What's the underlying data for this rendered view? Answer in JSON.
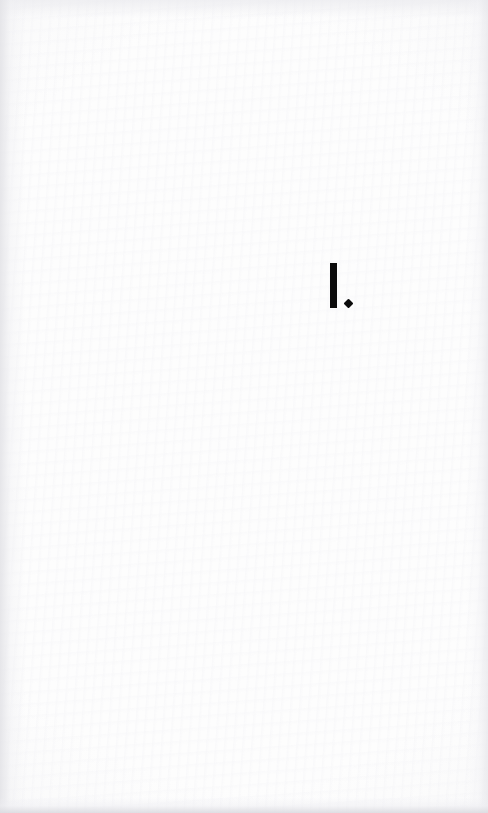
{
  "page": {
    "kind": "part-title-page",
    "background_color": "#fdfdfd",
    "ink_color": "#0b0b0b",
    "width": 488,
    "height": 813
  },
  "content": {
    "part_number": {
      "text": "I.",
      "numeral": "I",
      "punctuation": ".",
      "punctuation_shape": "diamond-period"
    }
  }
}
